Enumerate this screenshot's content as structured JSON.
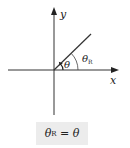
{
  "diagram": {
    "axes": {
      "x_label": "x",
      "y_label": "y"
    },
    "angles": {
      "theta": "θ",
      "theta_r_symbol": "θ",
      "theta_r_subscript": "R"
    },
    "formula": {
      "lhs_symbol": "θ",
      "lhs_subscript": "R",
      "equals": "=",
      "rhs_symbol": "θ"
    }
  }
}
